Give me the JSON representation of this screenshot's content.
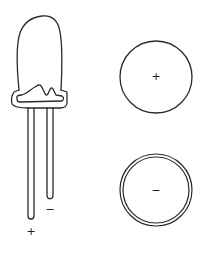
{
  "diagram": {
    "led": {
      "anode_label": "+",
      "cathode_label": "−"
    },
    "top_circle": {
      "label": "+"
    },
    "bottom_circle": {
      "label": "−"
    },
    "stroke_color": "#2a2a2a",
    "background": "#ffffff"
  }
}
